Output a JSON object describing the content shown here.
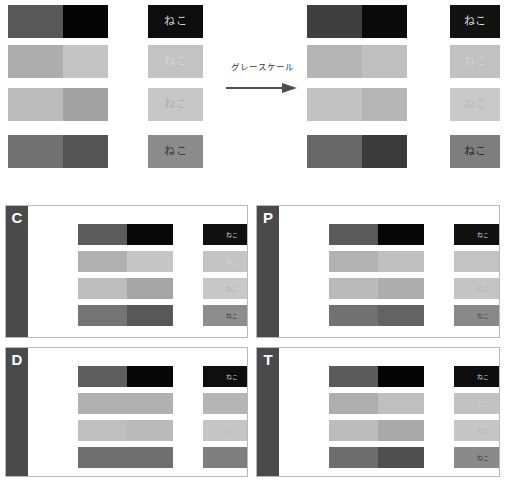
{
  "meta": {
    "word": "ねこ",
    "conversion_label": "グレースケール"
  },
  "top": {
    "left_group": {
      "name": "original",
      "x": 8,
      "swatch_width": 100,
      "text_x": 148,
      "text_width": 55,
      "rows": [
        {
          "left": "#585858",
          "right": "#050505",
          "text_bg": "#0d0d0d",
          "text_fg": "#cfcfcf"
        },
        {
          "left": "#adadad",
          "right": "#c4c4c4",
          "text_bg": "#c3c3c3",
          "text_fg": "#d5d5d5"
        },
        {
          "left": "#bcbcbc",
          "right": "#a2a2a2",
          "text_bg": "#c7c7c7",
          "text_fg": "#b0b0b0"
        },
        {
          "left": "#717171",
          "right": "#555555",
          "text_bg": "#8b8b8b",
          "text_fg": "#3a3a3a"
        }
      ]
    },
    "right_group": {
      "name": "grayscale",
      "x": 307,
      "swatch_width": 100,
      "text_x": 450,
      "text_width": 50,
      "rows": [
        {
          "left": "#3f3f3f",
          "right": "#0a0a0a",
          "text_bg": "#121212",
          "text_fg": "#d8d8d8"
        },
        {
          "left": "#b4b4b4",
          "right": "#bfbfbf",
          "text_bg": "#c1c1c1",
          "text_fg": "#cfcfcf"
        },
        {
          "left": "#c2c2c2",
          "right": "#b6b6b6",
          "text_bg": "#c9c9c9",
          "text_fg": "#bbbbbb"
        },
        {
          "left": "#686868",
          "right": "#3b3b3b",
          "text_bg": "#7e7e7e",
          "text_fg": "#2a2a2a"
        }
      ]
    },
    "row_y": [
      5,
      45,
      88,
      135
    ],
    "row_height": 33
  },
  "panels": [
    {
      "letter": "C",
      "name": "panel-c",
      "x": 5,
      "y": 205,
      "w": 243,
      "h": 133,
      "side_color": "#4a4a4a",
      "rows": [
        {
          "left": "#5c5c5c",
          "right": "#080808",
          "text_bg": "#101010",
          "text_fg": "#c9c9c9"
        },
        {
          "left": "#b0b0b0",
          "right": "#c6c6c6",
          "text_bg": "#c4c4c4",
          "text_fg": "#d4d4d4"
        },
        {
          "left": "#bdbdbd",
          "right": "#a5a5a5",
          "text_bg": "#c8c8c8",
          "text_fg": "#b2b2b2"
        },
        {
          "left": "#747474",
          "right": "#585858",
          "text_bg": "#8d8d8d",
          "text_fg": "#3d3d3d"
        }
      ]
    },
    {
      "letter": "P",
      "name": "panel-p",
      "x": 256,
      "y": 205,
      "w": 244,
      "h": 133,
      "side_color": "#4a4a4a",
      "rows": [
        {
          "left": "#5a5a5a",
          "right": "#070707",
          "text_bg": "#101010",
          "text_fg": "#c6c6c6"
        },
        {
          "left": "#b2b2b2",
          "right": "#c0c0c0",
          "text_bg": "#c3c3c3",
          "text_fg": "#cacaca"
        },
        {
          "left": "#bababa",
          "right": "#adadad",
          "text_bg": "#c4c4c4",
          "text_fg": "#b6b6b6"
        },
        {
          "left": "#717171",
          "right": "#636363",
          "text_bg": "#898989",
          "text_fg": "#4a4a4a"
        }
      ]
    },
    {
      "letter": "D",
      "name": "panel-d",
      "x": 5,
      "y": 347,
      "w": 243,
      "h": 130,
      "side_color": "#4a4a4a",
      "rows": [
        {
          "left": "#5e5e5e",
          "right": "#060606",
          "text_bg": "#0f0f0f",
          "text_fg": "#c4c4c4"
        },
        {
          "left": "#b1b1b1",
          "right": "#b1b1b1",
          "text_bg": "#b5b5b5",
          "text_fg": "#b5b5b5"
        },
        {
          "left": "#bfbfbf",
          "right": "#bababa",
          "text_bg": "#c6c6c6",
          "text_fg": "#bdbdbd"
        },
        {
          "left": "#6f6f6f",
          "right": "#6f6f6f",
          "text_bg": "#7e7e7e",
          "text_fg": "#7e7e7e"
        }
      ]
    },
    {
      "letter": "T",
      "name": "panel-t",
      "x": 256,
      "y": 347,
      "w": 244,
      "h": 130,
      "side_color": "#4a4a4a",
      "rows": [
        {
          "left": "#5b5b5b",
          "right": "#050505",
          "text_bg": "#0e0e0e",
          "text_fg": "#cbcbcb"
        },
        {
          "left": "#aeaeae",
          "right": "#bfbfbf",
          "text_bg": "#c2c2c2",
          "text_fg": "#cfcfcf"
        },
        {
          "left": "#bcbcbc",
          "right": "#a9a9a9",
          "text_bg": "#c6c6c6",
          "text_fg": "#b4b4b4"
        },
        {
          "left": "#6d6d6d",
          "right": "#4f4f4f",
          "text_bg": "#8a8a8a",
          "text_fg": "#3b3b3b"
        }
      ]
    }
  ],
  "panel_layout": {
    "swatch_x": 50,
    "swatch_w": 95,
    "split": 52,
    "text_x": 175,
    "text_w": 58,
    "row_y": [
      18,
      45,
      72,
      99
    ],
    "row_h": 21
  },
  "colors": {
    "page_background": "#ffffff",
    "panel_border": "#b9b9b9",
    "panel_side": "#4a4a4a",
    "arrow": "#4d4d4d",
    "label_text": "#3a3a3a"
  }
}
